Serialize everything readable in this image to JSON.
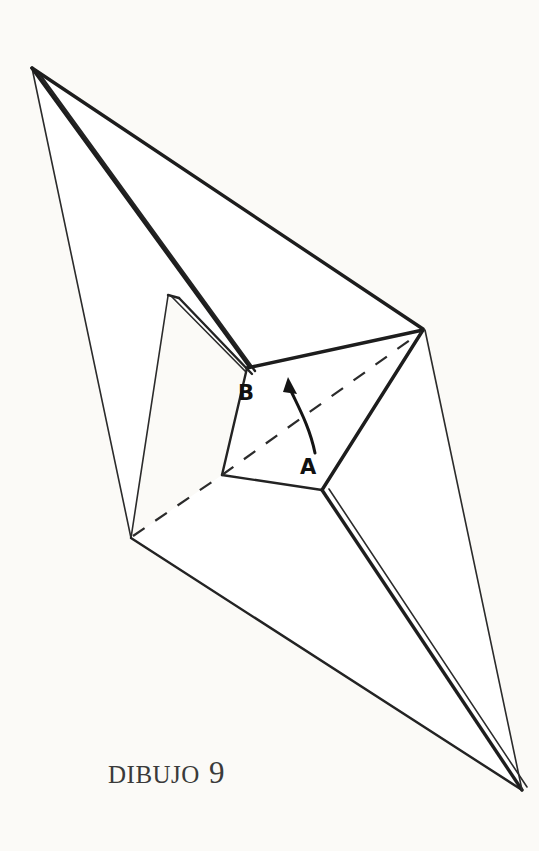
{
  "document": {
    "title": "Dibujo 9",
    "background_color": "#fbfaf7",
    "ink_color": "#232323",
    "width": 539,
    "height": 851
  },
  "caption": {
    "word": "DIBUJO",
    "number": "9",
    "full_text": "DIBUJO 9"
  },
  "figure": {
    "kind": "origami-folding-diagram",
    "labels": [
      {
        "id": "B",
        "text": "B",
        "x": 238,
        "y": 400
      },
      {
        "id": "A",
        "text": "A",
        "x": 300,
        "y": 474
      }
    ],
    "vertices": {
      "top_apex": {
        "x": 32,
        "y": 68
      },
      "notch_peak": {
        "x": 168,
        "y": 296
      },
      "b_corner": {
        "x": 247,
        "y": 368
      },
      "right_vertex": {
        "x": 423,
        "y": 330
      },
      "left_vertex": {
        "x": 131,
        "y": 538
      },
      "quad_left": {
        "x": 222,
        "y": 475
      },
      "a_corner": {
        "x": 322,
        "y": 490
      },
      "bottom_apex": {
        "x": 522,
        "y": 790
      }
    },
    "crease": {
      "style": "dashed",
      "from": "left_vertex",
      "to": "right_vertex",
      "via": "quad_left"
    },
    "arrow": {
      "style": "curved-with-head",
      "from_label": "A",
      "to_label": "B",
      "start": {
        "x": 314,
        "y": 452
      },
      "end": {
        "x": 290,
        "y": 380
      },
      "meaning": "rotate-fold"
    }
  }
}
